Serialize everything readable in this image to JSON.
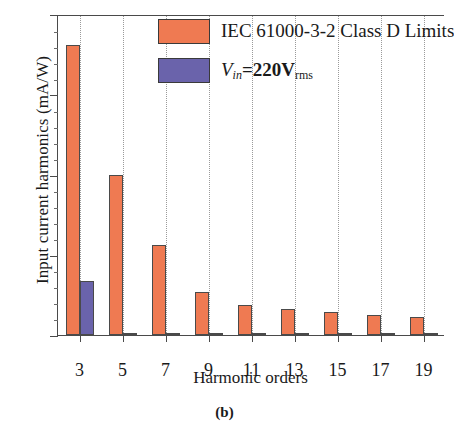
{
  "caption": "(b)",
  "legend": {
    "position": "top-right-inside",
    "items": [
      {
        "label": "IEC 61000-3-2 Class D Limits",
        "color": "#ef7a52",
        "key": "limits"
      },
      {
        "label": "Vin=220Vrms",
        "color": "#6a63ab",
        "key": "measured",
        "parts": {
          "v": "V",
          "sub_in": "in",
          "eq": "=220V",
          "sub_rms": "rms"
        }
      }
    ]
  },
  "chart_data": {
    "type": "bar",
    "title": "",
    "subtitle": "",
    "xlabel": "Harmonic orders",
    "ylabel": "Input current harmonics (mA/W)",
    "categories": [
      "3",
      "5",
      "7",
      "9",
      "11",
      "13",
      "15",
      "17",
      "19"
    ],
    "xlim": [
      2,
      20
    ],
    "ylim": [
      0,
      4
    ],
    "yticks": [
      "0",
      "1",
      "2",
      "3",
      "4"
    ],
    "ytick_values": [
      0,
      1,
      2,
      3,
      4
    ],
    "grid": "vertical-dotted",
    "series": [
      {
        "name": "IEC 61000-3-2 Class D Limits",
        "color": "#ef7a52",
        "values": [
          3.62,
          2.0,
          1.12,
          0.53,
          0.38,
          0.32,
          0.29,
          0.25,
          0.22
        ]
      },
      {
        "name": "Vin=220Vrms",
        "color": "#6a63ab",
        "values": [
          0.67,
          0.02,
          0.01,
          0.01,
          0.01,
          0.01,
          0.01,
          0.01,
          0.01
        ]
      }
    ]
  }
}
